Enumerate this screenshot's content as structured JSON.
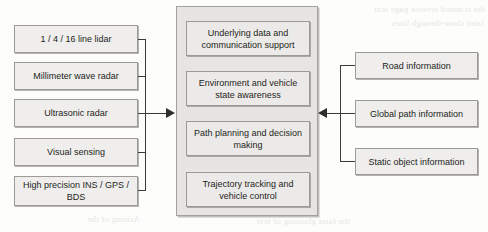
{
  "figure": {
    "background_color": "#fdfdfc",
    "node_fill": "#efeeec",
    "node_border": "#9b9a98",
    "panel_fill": "#e6e5e2",
    "connector_color": "#3b3b3a"
  },
  "sensors": {
    "group_label": "Sensor inputs",
    "items": [
      {
        "label": "1 / 4 / 16 line lidar"
      },
      {
        "label": "Millimeter wave radar"
      },
      {
        "label": "Ultrasonic radar"
      },
      {
        "label": "Visual sensing"
      },
      {
        "label": "High precision INS / GPS / BDS"
      }
    ]
  },
  "core": {
    "group_label": "Autonomous driving software stack",
    "layers": [
      {
        "label": "Underlying data and communication support"
      },
      {
        "label": "Environment and vehicle state awareness"
      },
      {
        "label": "Path planning and decision making"
      },
      {
        "label": "Trajectory tracking and vehicle control"
      }
    ]
  },
  "priors": {
    "group_label": "Prior information inputs",
    "items": [
      {
        "label": "Road information"
      },
      {
        "label": "Global path information"
      },
      {
        "label": "Static object information"
      }
    ]
  },
  "connectors": {
    "left_arrow": "arrow-right",
    "right_arrow": "arrow-left"
  },
  "bleed_text": {
    "top_right": "the scanned reverse page text",
    "mid_right": "faint show-through lines",
    "bottom_left": "Arising of the",
    "bottom_mid": "the faint ghosting of text"
  }
}
